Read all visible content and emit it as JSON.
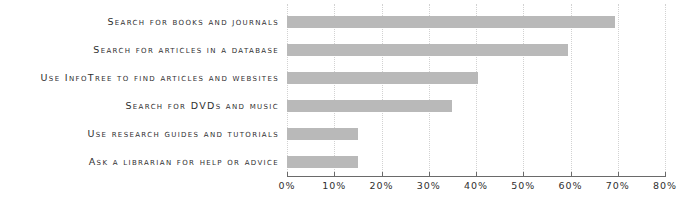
{
  "chart_data": {
    "type": "bar",
    "orientation": "horizontal",
    "title": "",
    "xlabel": "",
    "ylabel": "",
    "xlim": [
      0,
      80
    ],
    "grid": true,
    "legend": false,
    "bar_color": "#b9b9b9",
    "axis_color": "#6a6a6a",
    "gridline_color": "#d2d2d2",
    "background_color": "#ffffff",
    "tick_labels": [
      "0%",
      "10%",
      "20%",
      "30%",
      "40%",
      "50%",
      "60%",
      "70%",
      "80%"
    ],
    "tick_values": [
      0,
      10,
      20,
      30,
      40,
      50,
      60,
      70,
      80
    ],
    "categories": [
      "Search for books and journals",
      "Search for articles in a database",
      "Use InfoTree to find articles and websites",
      "Search for DVDs and music",
      "Use research guides and tutorials",
      "Ask a librarian for help or advice"
    ],
    "values": [
      69.5,
      59.5,
      40.5,
      35,
      15,
      15
    ]
  }
}
